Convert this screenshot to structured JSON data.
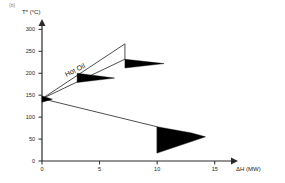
{
  "figure": {
    "panel_label": "(b)",
    "series_annotation": "Hot Oil"
  },
  "chart_data": {
    "type": "line",
    "title": "",
    "subtitle": "",
    "xlabel": "ΔH (MW)",
    "ylabel": "T* (°C)",
    "xlim": [
      0,
      16.5
    ],
    "ylim": [
      0,
      310
    ],
    "xticks": [
      0,
      5,
      10,
      15
    ],
    "xtick_labels": [
      "0",
      "5",
      "10",
      "15"
    ],
    "yticks": [
      0,
      50,
      100,
      150,
      200,
      250,
      300
    ],
    "ytick_labels": [
      "0",
      "50",
      "100",
      "150",
      "200",
      "250",
      "300"
    ],
    "grid": false,
    "legend": null,
    "pinch_point": {
      "x": 0,
      "y": 142
    },
    "annotations": [
      {
        "text": "Hot Oil",
        "x": 2.2,
        "y": 205,
        "rotation": -27
      },
      {
        "text": "(b)",
        "x": 0,
        "y": 310
      }
    ],
    "series": [
      {
        "name": "grand-composite-upper",
        "comment": "upper pocket boundary rising from pinch to peak then vertical drop",
        "points": [
          [
            0,
            142
          ],
          [
            7.2,
            267
          ],
          [
            7.2,
            232
          ]
        ]
      },
      {
        "name": "grand-composite-middle",
        "comment": "hot oil utility profile line from pinch to upper wedge tip",
        "points": [
          [
            0,
            142
          ],
          [
            7.2,
            232
          ]
        ]
      },
      {
        "name": "grand-composite-lower",
        "comment": "descending segment below pinch to cold utility region",
        "points": [
          [
            0,
            142
          ],
          [
            10.0,
            78
          ]
        ]
      },
      {
        "name": "cold-utility-vertical",
        "comment": "vertical edge of the cold utility wedge",
        "points": [
          [
            10.0,
            78
          ],
          [
            10.0,
            18
          ]
        ]
      }
    ],
    "wedges": [
      {
        "name": "hot-oil-upper-wedge",
        "fill": "#000000",
        "points": [
          [
            7.2,
            232
          ],
          [
            7.2,
            212
          ],
          [
            10.6,
            222
          ]
        ]
      },
      {
        "name": "hot-oil-lower-wedge",
        "fill": "#000000",
        "points": [
          [
            3.05,
            200
          ],
          [
            3.05,
            179
          ],
          [
            6.3,
            189
          ]
        ]
      },
      {
        "name": "cold-utility-wedge",
        "fill": "#000000",
        "points": [
          [
            10.0,
            78
          ],
          [
            10.0,
            18
          ],
          [
            14.2,
            55
          ],
          [
            13.0,
            64
          ]
        ]
      },
      {
        "name": "pinch-marker-wedge",
        "fill": "#000000",
        "points": [
          [
            0,
            148
          ],
          [
            0,
            134
          ],
          [
            0.9,
            141
          ]
        ]
      }
    ],
    "colors": {
      "axis": "#2b2b2b",
      "line": "#3a3a3a",
      "fill": "#000000",
      "text": "#1a1a1a",
      "background": "#ffffff"
    }
  }
}
